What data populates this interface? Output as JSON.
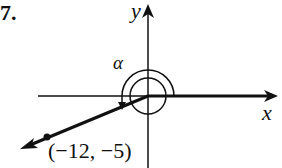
{
  "problem_number": "7.",
  "axes": {
    "x_label": "x",
    "y_label": "y"
  },
  "angle_label": "α",
  "point": {
    "label": "(−12, −5)",
    "x": -12,
    "y": -5
  },
  "colors": {
    "ink": "#111111",
    "background": "#ffffff"
  }
}
